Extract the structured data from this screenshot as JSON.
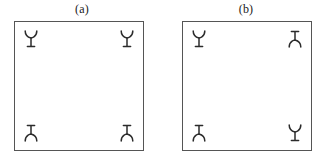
{
  "figure": {
    "background_color": "#ffffff",
    "stroke_color": "#2b2b2b",
    "box_border_color": "#555555",
    "panels": [
      {
        "label": "(a)",
        "name": "panel-a",
        "symbols": [
          {
            "position": "top-left",
            "orientation": "up",
            "icon": "y-receptor-icon"
          },
          {
            "position": "top-right",
            "orientation": "up",
            "icon": "y-receptor-icon"
          },
          {
            "position": "bottom-left",
            "orientation": "down",
            "icon": "y-receptor-icon"
          },
          {
            "position": "bottom-right",
            "orientation": "down",
            "icon": "y-receptor-icon"
          }
        ]
      },
      {
        "label": "(b)",
        "name": "panel-b",
        "symbols": [
          {
            "position": "top-left",
            "orientation": "up",
            "icon": "y-receptor-icon"
          },
          {
            "position": "top-right",
            "orientation": "down",
            "icon": "y-receptor-icon"
          },
          {
            "position": "bottom-left",
            "orientation": "down",
            "icon": "y-receptor-icon"
          },
          {
            "position": "bottom-right",
            "orientation": "up",
            "icon": "y-receptor-icon"
          }
        ]
      }
    ]
  }
}
